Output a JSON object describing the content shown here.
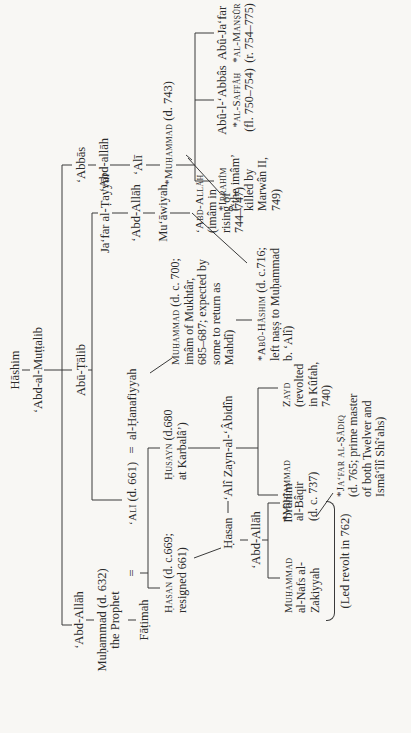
{
  "diagram": {
    "type": "genealogy-tree",
    "orientation": "rotated-90-ccw",
    "root": "Hāshim",
    "nodes": {
      "hashim": "Hāshim",
      "abd_al_muttalib": "‘Abd-al-Muṭṭalib",
      "abd_allah_father": "‘Abd-Allāh",
      "prophet": "Muḥammad (d. 632)",
      "prophet_sub": "the Prophet",
      "fatimah": "Fāṭimah",
      "marriage_sign": "=",
      "abu_talib": "Abū-Ṭālib",
      "ali": "‘Alī (d. 661)",
      "ali_sc": "‘Alī",
      "ali_rest": " (d. 661)",
      "hanafiyyah": "al-Ḥanafiyyah",
      "marriage_sign2": "=",
      "jafar_tayyar": "Ja‘far al-Ṭayyār",
      "abd_allah_jafar": "‘Abd-Allāh",
      "muawiyah": "Mu‘āwiyah",
      "abd_allah_muawiyah_name": "‘Abd-Allāh",
      "abd_allah_muawiyah_lines": [
        "(imâm in",
        "rising of",
        "744–747)"
      ],
      "muhammad_hanafiyyah_name": "Muḥammad",
      "muhammad_hanafiyyah_rest": " (d. c. 700;",
      "muhammad_hanafiyyah_lines": [
        "imâm of Mukhtâr,",
        "685–687; expected by",
        "some to return as",
        "Mahdî)"
      ],
      "abu_hashim_name": "*Abû-Hâshim",
      "abu_hashim_rest": " (d. c.716;",
      "abu_hashim_lines": [
        "left naṣṣ to Muḥammad",
        "b. ‘Alî)"
      ],
      "abbas": "‘Abbās",
      "abd_allah_abbas": "‘Abd-allāh",
      "ali_abbas": "‘Alī",
      "muhammad_abbasid_name": "*Muḥammad",
      "muhammad_abbasid_rest": " (d. 743)",
      "ibrahim_name": "*Ibrahîm",
      "ibrahim_lines": [
        "(‘the imâm’",
        "killed by",
        "Marwân II,",
        "749)"
      ],
      "saffah_name": "Abû-l-‘Abbâs",
      "saffah_title": "*al-Saffâḥ",
      "saffah_reign": "(fl. 750–754)",
      "mansur_name": "Abû-Ja‘far",
      "mansur_title": "*al-Manṣûr",
      "mansur_reign": "(r. 754–775)",
      "hasan_name": "Ḥasan",
      "hasan_rest": " (d. c.669;",
      "hasan_line2": "resigned 661)",
      "husayn_name": "Ḥusayn",
      "husayn_rest": " (d.680",
      "husayn_line2": "at Karbalâ’)",
      "hasan2": "Ḥasan",
      "abd_allah_hasan": "‘Abd-Allāh",
      "muhammad_nafs_name": "Muḥammad",
      "muhammad_nafs_lines": [
        "al-Nafs al-",
        "Zakiyyah"
      ],
      "ibrahim_hasan": "Ibrâhîm",
      "led_revolt": "(Led revolt in 762)",
      "zayn": "‘Alî Zayn-al-‘Âbidîn",
      "baqir_name": "*Muḥammad",
      "baqir_lines": [
        "al-Bâqir",
        "(d. c. 737)"
      ],
      "zayd_name": "Zayd",
      "zayd_lines": [
        "(revolted",
        "in Kûfah,",
        "740)"
      ],
      "sadiq_name": "*Ja‘far al-Ṣâdiq",
      "sadiq_lines": [
        "(d. 765; prime master",
        "of both Twelver and",
        "Ismâ‘îlî Shî‘ahs)"
      ]
    }
  }
}
